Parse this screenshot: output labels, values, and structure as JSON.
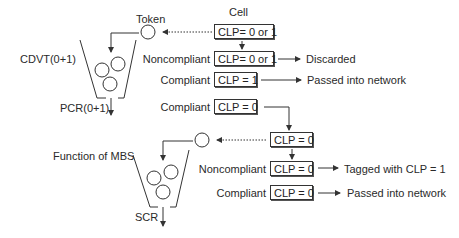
{
  "title": "Cell",
  "token_label": "Token",
  "bucket1": {
    "label": "CDVT(0+1)",
    "output_label": "PCR(0+1)"
  },
  "bucket2": {
    "label": "Function of MBS",
    "output_label": "SCR"
  },
  "stage1": {
    "input_box": "CLP= 0 or 1",
    "rows": [
      {
        "status": "Noncompliant",
        "box": "CLP= 0 or 1",
        "result": "Discarded"
      },
      {
        "status": "Compliant",
        "box": "CLP = 1",
        "result": "Passed into network"
      },
      {
        "status": "Compliant",
        "box": "CLP = 0",
        "result": ""
      }
    ]
  },
  "stage2": {
    "input_box": "CLP = 0",
    "rows": [
      {
        "status": "Noncompliant",
        "box": "CLP = 0",
        "result": "Tagged with CLP = 1"
      },
      {
        "status": "Compliant",
        "box": "CLP = 0",
        "result": "Passed into network"
      }
    ]
  },
  "colors": {
    "line": "#333333",
    "text": "#222222",
    "background": "#ffffff"
  }
}
